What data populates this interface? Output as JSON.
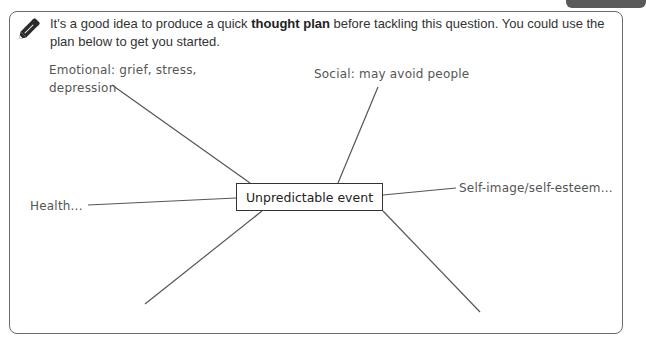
{
  "instruction": {
    "icon": "pencil-icon",
    "text_before": "It's a good idea to produce a quick ",
    "text_bold": "thought plan",
    "text_after": " before tackling this question. You could use the plan below to get you started."
  },
  "mind_map": {
    "center": "Unpredictable event",
    "branches": [
      {
        "position": "top-left",
        "label_line1": "Emotional: grief, stress,",
        "label_line2": "depression"
      },
      {
        "position": "top-center",
        "label": "Social: may avoid people"
      },
      {
        "position": "right",
        "label": "Self-image/self-esteem..."
      },
      {
        "position": "left",
        "label": "Health..."
      },
      {
        "position": "bottom-left",
        "label": ""
      },
      {
        "position": "bottom-right",
        "label": ""
      }
    ]
  },
  "colors": {
    "border": "#6b6b6b",
    "line": "#555555",
    "label_text": "#555555",
    "tab": "#5a5a5a"
  }
}
